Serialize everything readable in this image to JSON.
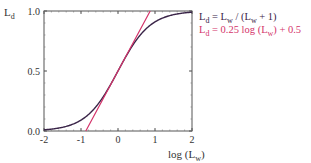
{
  "chart_data": {
    "type": "line",
    "title": "",
    "xlabel": "log (L",
    "xlabel_sub": "w",
    "xlabel_close": ")",
    "ylabel": "L",
    "ylabel_sub": "d",
    "xlim": [
      -2,
      2
    ],
    "ylim": [
      0,
      1
    ],
    "x_ticks": [
      -2,
      -1,
      0,
      1,
      2
    ],
    "x_tick_labels": [
      "-2",
      "-1",
      "0",
      "1",
      "2"
    ],
    "y_ticks": [
      0,
      0.5,
      1
    ],
    "y_tick_labels": [
      "0.0",
      "0.5",
      "1.0"
    ],
    "grid": false,
    "legend_position": "right-top",
    "series": [
      {
        "name": "L_d = L_w / (L_w + 1)",
        "color": "#3a2448",
        "x": [
          -2,
          -1.5,
          -1,
          -0.5,
          0,
          0.5,
          1,
          1.5,
          2
        ],
        "values": [
          0.0099,
          0.0307,
          0.0909,
          0.2402,
          0.5,
          0.7597,
          0.9091,
          0.9693,
          0.9901
        ]
      },
      {
        "name": "L_d = 0.25 log (L_w) + 0.5",
        "color": "#d4336a",
        "x": [
          -0.87,
          -0.5,
          0,
          0.5,
          0.87
        ],
        "values": [
          0.0,
          0.212,
          0.5,
          0.788,
          1.0
        ]
      }
    ]
  },
  "legend": {
    "line1": {
      "a": "L",
      "a_sub": "d",
      "b": " = L",
      "b_sub": "w",
      "c": " / (L",
      "c_sub": "w",
      "d": " + 1)"
    },
    "line2": {
      "a": "L",
      "a_sub": "d",
      "b": " = 0.25 log (L",
      "b_sub": "w",
      "c": ") + 0.5"
    }
  }
}
